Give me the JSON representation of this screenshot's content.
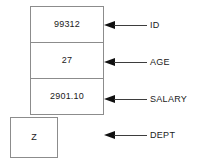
{
  "diagram": {
    "type": "record-structure-annotated",
    "fields": [
      {
        "label": "ID",
        "value": "99312",
        "icon": "left-arrow-icon"
      },
      {
        "label": "AGE",
        "value": "27",
        "icon": "left-arrow-icon"
      },
      {
        "label": "SALARY",
        "value": "2901.10",
        "icon": "left-arrow-icon"
      },
      {
        "label": "DEPT",
        "value": "Z",
        "icon": "left-arrow-icon"
      }
    ],
    "colors": {
      "box_border": "#8c8c8c",
      "box_fill": "#ffffff",
      "text": "#1a1a1a",
      "arrow": "#111111",
      "background": "#ffffff"
    }
  }
}
